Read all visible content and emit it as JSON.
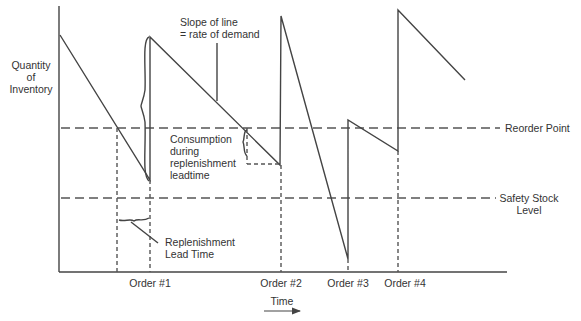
{
  "diagram": {
    "y_axis_label": [
      "Quantity",
      "of",
      "Inventory"
    ],
    "x_axis_label": "Time",
    "annotations": {
      "slope": [
        "Slope of line",
        "= rate of demand"
      ],
      "consumption": [
        "Consumption",
        "during",
        "replenishment",
        "leadtime"
      ],
      "lead_time": [
        "Replenishment",
        "Lead Time"
      ],
      "reorder_point": "Reorder Point",
      "safety_stock": [
        "Safety Stock",
        "Level"
      ]
    },
    "orders": [
      {
        "label": "Order #1"
      },
      {
        "label": "Order #2"
      },
      {
        "label": "Order #3"
      },
      {
        "label": "Order #4"
      }
    ],
    "colors": {
      "line": "#444444",
      "text": "#333333",
      "background": "#ffffff"
    }
  }
}
